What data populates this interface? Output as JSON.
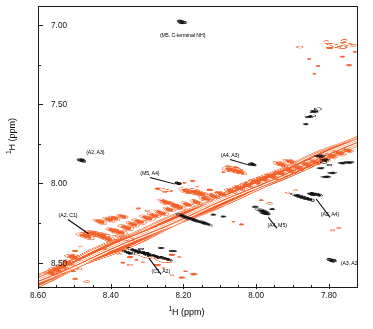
{
  "chart_data": {
    "type": "scatter",
    "title": "",
    "subtitle": "",
    "xlabel": "1H (ppm)",
    "ylabel": "1H (ppm)",
    "xlabel_sup": "1",
    "xlabel_rest": "H (ppm)",
    "ylabel_sup": "1",
    "ylabel_rest": "H (ppm)",
    "xlim": [
      8.6,
      7.72
    ],
    "ylim": [
      6.88,
      8.66
    ],
    "x_inverted": true,
    "y_inverted": true,
    "grid": false,
    "legend": "none",
    "xticks": [
      8.6,
      8.4,
      8.2,
      8.0,
      7.8
    ],
    "xtick_labels": [
      "8.60",
      "8.40",
      "8.20",
      "8.00",
      "7.80"
    ],
    "xminor_ticks": [
      8.55,
      8.5,
      8.45,
      8.35,
      8.3,
      8.25,
      8.15,
      8.1,
      8.05,
      7.95,
      7.9,
      7.85,
      7.75
    ],
    "yticks": [
      7.0,
      7.5,
      8.0,
      8.5
    ],
    "ytick_labels": [
      "7.00",
      "7.50",
      "8.00",
      "8.50"
    ],
    "yminor_ticks": [
      7.25,
      7.75,
      8.25
    ],
    "accent_color": "#F4622A",
    "contour_color_positive": "#F4622A",
    "contour_color_negative": "#111111",
    "annotations": [
      {
        "label": "(M5, C-terminal NH)",
        "peak_x": 8.205,
        "peak_y": 6.975,
        "label_x": 8.205,
        "label_y": 7.055,
        "leader": false,
        "color": "#000000"
      },
      {
        "label": "(A2, A3)",
        "peak_x": 8.482,
        "peak_y": 7.855,
        "label_x": 8.445,
        "label_y": 7.795,
        "leader": false,
        "color": "#000000"
      },
      {
        "label": "(A4, A3)",
        "peak_x": 8.01,
        "peak_y": 7.88,
        "label_x": 8.075,
        "label_y": 7.815,
        "leader": true,
        "color": "#000000"
      },
      {
        "label": "(M5, A4)",
        "peak_x": 8.215,
        "peak_y": 8.0,
        "label_x": 8.295,
        "label_y": 7.93,
        "leader": true,
        "color": "#000000"
      },
      {
        "label": "(A2, C1)",
        "peak_x": 8.455,
        "peak_y": 8.32,
        "label_x": 8.52,
        "label_y": 8.195,
        "leader": true,
        "color": "#000000"
      },
      {
        "label": "(A3, A4)",
        "peak_x": 7.845,
        "peak_y": 8.07,
        "label_x": 7.8,
        "label_y": 8.185,
        "leader": true,
        "color": "#000000"
      },
      {
        "label": "(A4, M5)",
        "peak_x": 7.975,
        "peak_y": 8.19,
        "label_x": 7.945,
        "label_y": 8.255,
        "leader": true,
        "color": "#000000"
      },
      {
        "label": "(C1, A2)",
        "peak_x": 8.305,
        "peak_y": 8.445,
        "label_x": 8.265,
        "label_y": 8.545,
        "leader": true,
        "color": "#000000"
      },
      {
        "label": "(A3, A2)",
        "peak_x": 7.79,
        "peak_y": 8.49,
        "label_x": 7.745,
        "label_y": 8.495,
        "leader": false,
        "color": "#000000"
      }
    ],
    "cross_peaks": [
      {
        "name": "M5-Cterm-NH",
        "x": 8.205,
        "y": 6.975,
        "sign": "negative",
        "size": 6.5
      },
      {
        "name": "A2-A3",
        "x": 8.482,
        "y": 7.855,
        "sign": "negative",
        "size": 6.0
      },
      {
        "name": "A4-A3",
        "x": 8.01,
        "y": 7.88,
        "sign": "negative",
        "size": 5.4
      },
      {
        "name": "M5-A4",
        "x": 8.215,
        "y": 8.0,
        "sign": "negative",
        "size": 4.6
      },
      {
        "name": "A3-A4",
        "x": 7.845,
        "y": 8.07,
        "sign": "negative",
        "size": 5.2
      },
      {
        "name": "A4-M5",
        "x": 7.975,
        "y": 8.19,
        "sign": "negative",
        "size": 6.2
      },
      {
        "name": "C1-A2",
        "x": 8.305,
        "y": 8.445,
        "sign": "negative",
        "size": 5.6
      },
      {
        "name": "A3-A2",
        "x": 7.79,
        "y": 8.49,
        "sign": "negative",
        "size": 6.4
      },
      {
        "name": "A2-C1",
        "x": 8.455,
        "y": 8.32,
        "sign": "positive",
        "size": 3.2
      }
    ],
    "diagonal": {
      "description": "intense orange diagonal ridge running from 8.60/8.60 to 7.72/7.72",
      "color": "#F4622A"
    }
  },
  "axes": {
    "x_title_sup": "1",
    "x_title_rest": "H (ppm)",
    "y_title_sup": "1",
    "y_title_rest": "H (ppm)"
  }
}
